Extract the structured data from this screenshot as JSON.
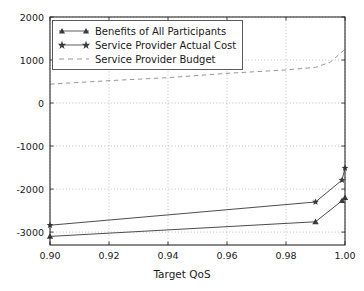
{
  "chart_data": {
    "type": "line",
    "title": "",
    "xlabel": "Target QoS",
    "ylabel": "",
    "xlim": [
      0.9,
      1.0
    ],
    "ylim": [
      -3300,
      2000
    ],
    "grid": true,
    "grid_style": "dotted",
    "legend_position": "upper left",
    "xticks": [
      "0.90",
      "0.92",
      "0.94",
      "0.96",
      "0.98",
      "1.00"
    ],
    "xtick_values": [
      0.9,
      0.92,
      0.94,
      0.96,
      0.98,
      1.0
    ],
    "yticks": [
      "2000",
      "1000",
      "0",
      "-1000",
      "-2000",
      "-3000"
    ],
    "ytick_values": [
      2000,
      1000,
      0,
      -1000,
      -2000,
      -3000
    ],
    "series": [
      {
        "name": "Benefits of All Participants",
        "marker": "triangle",
        "linestyle": "solid",
        "color": "#4d4d4d",
        "x": [
          0.9,
          0.99,
          0.999,
          1.0
        ],
        "values": [
          -3100,
          -2760,
          -2270,
          -2200
        ]
      },
      {
        "name": "Service Provider Actual Cost",
        "marker": "star",
        "linestyle": "solid",
        "color": "#4d4d4d",
        "x": [
          0.9,
          0.99,
          0.999,
          1.0
        ],
        "values": [
          -2840,
          -2300,
          -1790,
          -1510
        ]
      },
      {
        "name": "Service Provider Budget",
        "marker": "none",
        "linestyle": "dashed",
        "color": "#8c8c8c",
        "x": [
          0.9,
          0.92,
          0.94,
          0.96,
          0.98,
          0.99,
          0.995,
          1.0
        ],
        "values": [
          440,
          520,
          590,
          690,
          770,
          830,
          950,
          1250
        ]
      }
    ]
  },
  "legend": {
    "items": [
      {
        "label": "Benefits of All Participants",
        "marker": "triangle"
      },
      {
        "label": "Service Provider Actual Cost",
        "marker": "star"
      },
      {
        "label": "Service Provider Budget",
        "marker": "none"
      }
    ]
  },
  "axes": {
    "xlabel": "Target QoS",
    "xticks": [
      {
        "label": "0.90"
      },
      {
        "label": "0.92"
      },
      {
        "label": "0.94"
      },
      {
        "label": "0.96"
      },
      {
        "label": "0.98"
      },
      {
        "label": "1.00"
      }
    ],
    "yticks": [
      {
        "label": "2000"
      },
      {
        "label": "1000"
      },
      {
        "label": "0"
      },
      {
        "label": "-1000"
      },
      {
        "label": "-2000"
      },
      {
        "label": "-3000"
      }
    ]
  },
  "colors": {
    "axis": "#2b2b2b",
    "grid": "#b0b0b0",
    "series_dark": "#4d4d4d",
    "series_light": "#8c8c8c",
    "text": "#1a1a1a",
    "background": "#ffffff"
  }
}
